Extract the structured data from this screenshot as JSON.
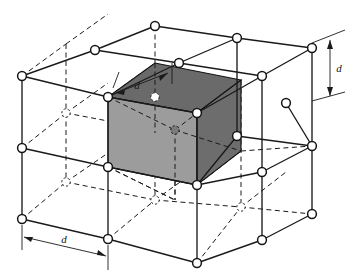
{
  "figure": {
    "name": "crystal-lattice-unit-cell-diagram",
    "background_color": "#ffffff",
    "line_color": "#1a1a1a",
    "node_fill": "#ffffff",
    "node_stroke": "#1a1a1a",
    "shaded_cube": {
      "top_face_color": "#6a6a6a",
      "left_face_color": "#9c9c9c",
      "right_face_color": "#6d6d6d",
      "edge_color": "#111111"
    }
  },
  "dimensions": [
    {
      "id": "depth",
      "label": "d",
      "orientation": "diagonal-depth",
      "position": "top-left-of-shaded-cube"
    },
    {
      "id": "width",
      "label": "d",
      "orientation": "horizontal-width",
      "position": "bottom-front-edge"
    },
    {
      "id": "height",
      "label": "d",
      "orientation": "vertical-height",
      "position": "right-side-edge"
    }
  ],
  "lattice": {
    "cells_per_axis": 2,
    "nodes_per_axis": 3,
    "total_nodes": 27,
    "node_radius": 4.2,
    "visible_node_count": 21,
    "hidden_node_count": 6,
    "solid_nodes": [
      {
        "x": 155,
        "y": 26
      },
      {
        "x": 237,
        "y": 38
      },
      {
        "x": 312,
        "y": 48
      },
      {
        "x": 95,
        "y": 50
      },
      {
        "x": 179,
        "y": 63
      },
      {
        "x": 262,
        "y": 76
      },
      {
        "x": 22,
        "y": 76
      },
      {
        "x": 108,
        "y": 97
      },
      {
        "x": 197,
        "y": 113
      },
      {
        "x": 312,
        "y": 146
      },
      {
        "x": 262,
        "y": 172
      },
      {
        "x": 22,
        "y": 148
      },
      {
        "x": 108,
        "y": 167
      },
      {
        "x": 197,
        "y": 185
      },
      {
        "x": 237,
        "y": 136
      },
      {
        "x": 22,
        "y": 219
      },
      {
        "x": 108,
        "y": 239
      },
      {
        "x": 197,
        "y": 263
      },
      {
        "x": 262,
        "y": 240
      },
      {
        "x": 312,
        "y": 214
      },
      {
        "x": 286,
        "y": 103
      }
    ],
    "hidden_nodes": [
      {
        "x": 66,
        "y": 113
      },
      {
        "x": 66,
        "y": 182
      },
      {
        "x": 155,
        "y": 97
      },
      {
        "x": 155,
        "y": 200
      },
      {
        "x": 175,
        "y": 130
      },
      {
        "x": 241,
        "y": 207
      }
    ]
  },
  "shaded_cell": {
    "label": "unit-cell",
    "front_top_left": {
      "x": 108,
      "y": 97
    },
    "front_top_right": {
      "x": 197,
      "y": 113
    },
    "front_bot_left": {
      "x": 108,
      "y": 167
    },
    "front_bot_right": {
      "x": 197,
      "y": 185
    },
    "back_top_left": {
      "x": 155,
      "y": 63
    },
    "back_top_right": {
      "x": 241,
      "y": 80
    }
  }
}
